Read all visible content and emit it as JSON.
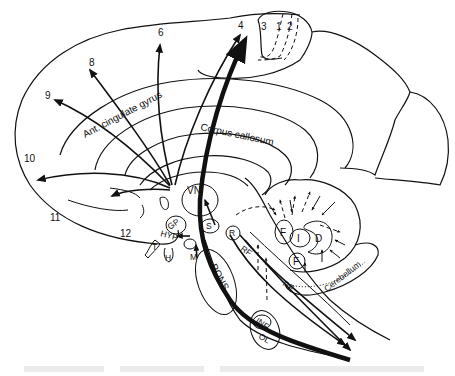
{
  "diagram": {
    "cortical_areas": [
      "4",
      "6",
      "8",
      "9",
      "10",
      "11",
      "12",
      "3",
      "1",
      "2"
    ],
    "region_labels": {
      "ant_cingulate": "Ant. cingulate gyrus",
      "corpus_callosum": "Corpus callosum",
      "vn": "VN",
      "gp": "GP",
      "hyp": "HYP",
      "t": "T",
      "m": "M",
      "h": "H",
      "s": "S",
      "r": "R",
      "pons": "PONS",
      "rf1": "RF",
      "rf2": "RF",
      "inf": "INF",
      "ol": "OL",
      "f_upper": "F",
      "f_lower": "F",
      "i": "I",
      "d": "D",
      "cerebellum": "Cerebellum"
    },
    "labels": {
      "area_4": "4",
      "area_6": "6",
      "area_8": "8",
      "area_9": "9",
      "area_10": "10",
      "area_11": "11",
      "area_12": "12",
      "area_3": "3",
      "area_1": "1",
      "area_2": "2"
    },
    "colors": {
      "ink": "#111111",
      "paper": "#ffffff"
    }
  }
}
